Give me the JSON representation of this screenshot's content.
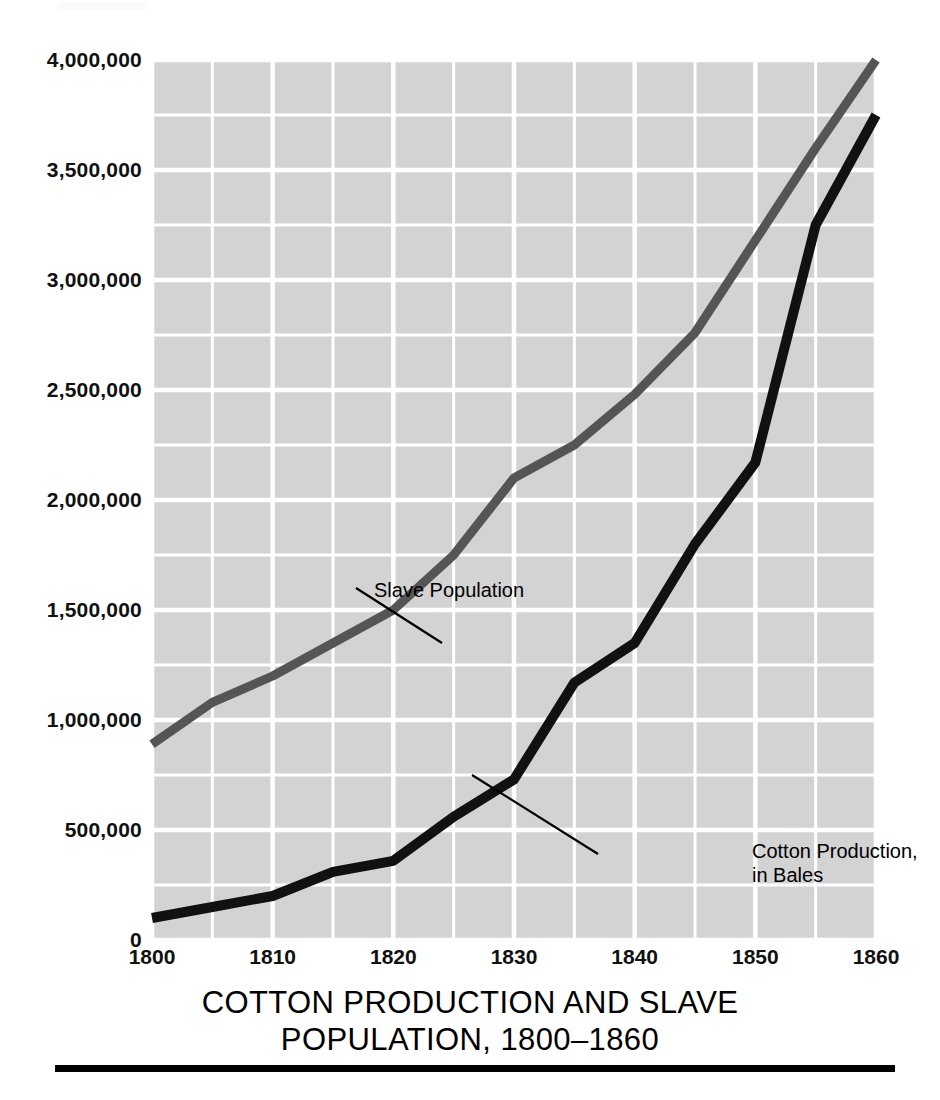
{
  "figure": {
    "title_lines": [
      "COTTON PRODUCTION AND SLAVE",
      "POPULATION, 1800–1860"
    ],
    "plot_background_color": "#d3d3d3",
    "gridline_color": "#ffffff",
    "page_background_color": "#ffffff"
  },
  "axes": {
    "y_tick_labels": [
      "4,000,000",
      "3,500,000",
      "3,000,000",
      "2,500,000",
      "2,000,000",
      "1,500,000",
      "1,000,000",
      "500,000",
      "0"
    ],
    "x_tick_labels": [
      "1800",
      "1810",
      "1820",
      "1830",
      "1840",
      "1850",
      "1860"
    ]
  },
  "annotations": {
    "slave_label": "Slave Population",
    "cotton_label_line1": "Cotton Production,",
    "cotton_label_line2": "in Bales"
  },
  "chart_data": {
    "type": "line",
    "title": "COTTON PRODUCTION AND SLAVE POPULATION, 1800–1860",
    "xlabel": "",
    "ylabel": "",
    "xlim": [
      1800,
      1860
    ],
    "ylim": [
      0,
      4000000
    ],
    "x_major_ticks": [
      1800,
      1810,
      1820,
      1830,
      1840,
      1850,
      1860
    ],
    "x_minor_step": 5,
    "y_major_ticks": [
      0,
      500000,
      1000000,
      1500000,
      2000000,
      2500000,
      3000000,
      3500000,
      4000000
    ],
    "y_minor_step": 250000,
    "grid": true,
    "legend": "inline-annotations",
    "x": [
      1800,
      1805,
      1810,
      1815,
      1820,
      1825,
      1830,
      1835,
      1840,
      1845,
      1850,
      1855,
      1860
    ],
    "series": [
      {
        "name": "Slave Population",
        "color": "#555555",
        "line_width": 9,
        "values": [
          890000,
          1080000,
          1200000,
          1350000,
          1500000,
          1750000,
          2100000,
          2250000,
          2480000,
          2760000,
          3180000,
          3600000,
          4000000
        ]
      },
      {
        "name": "Cotton Production, in Bales",
        "color": "#111111",
        "line_width": 10,
        "values": [
          100000,
          150000,
          200000,
          310000,
          360000,
          560000,
          730000,
          1170000,
          1350000,
          1800000,
          2170000,
          3250000,
          3750000
        ]
      }
    ]
  }
}
